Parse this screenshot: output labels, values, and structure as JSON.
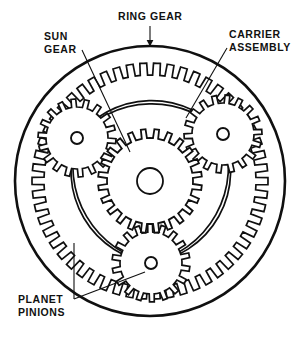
{
  "diagram": {
    "type": "mechanical-cutaway",
    "labels": {
      "ring_gear": "RING GEAR",
      "sun_gear": "SUN\nGEAR",
      "carrier_assembly": "CARRIER\nASSEMBLY",
      "planet_pinions": "PLANET\nPINIONS"
    },
    "colors": {
      "stroke": "#101010",
      "background": "#ffffff",
      "fill": "#ffffff"
    },
    "geometry": {
      "center": {
        "x": 150,
        "y": 181
      },
      "ring_gear_outer_radius": 135,
      "ring_gear_tooth_root_radius": 118,
      "ring_gear_tooth_tip_radius": 106,
      "ring_gear_tooth_count": 54,
      "sun_gear_radius": 52,
      "sun_gear_root_radius": 43,
      "sun_gear_tooth_count": 24,
      "sun_gear_bore_radius": 13,
      "planet_radius": 39,
      "planet_root_radius": 31,
      "planet_tooth_count": 18,
      "planet_orbit_radius": 82,
      "planet_pin_radius": 6,
      "carrier_arc_radius": 96,
      "carrier_band_width": 6,
      "planets": [
        {
          "name": "planet-left",
          "x": 77,
          "y": 138,
          "angle_deg": 210
        },
        {
          "name": "planet-right",
          "x": 223,
          "y": 134,
          "angle_deg": 330
        },
        {
          "name": "planet-bottom",
          "x": 151,
          "y": 263,
          "angle_deg": 90
        }
      ]
    },
    "leaders": {
      "ring_gear": {
        "from": {
          "x": 150,
          "y": 26
        },
        "to": {
          "x": 150,
          "y": 46
        },
        "arrow": true
      },
      "sun_gear": {
        "from": {
          "x": 82,
          "y": 50
        },
        "to": {
          "x": 130,
          "y": 152
        },
        "arrow": false
      },
      "carrier_assembly": {
        "from": {
          "x": 227,
          "y": 48
        },
        "to": {
          "x": 186,
          "y": 118
        },
        "arrow": false
      },
      "planet_pinions": {
        "from": {
          "x": 74,
          "y": 299
        },
        "to": {
          "x": 145,
          "y": 272
        },
        "arrow": false
      }
    }
  }
}
